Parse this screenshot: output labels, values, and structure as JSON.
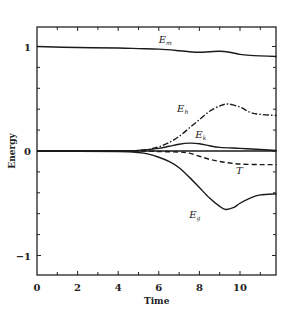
{
  "chart_data": {
    "type": "line",
    "title": "",
    "xlabel": "Time",
    "ylabel": "Energy",
    "xlim": [
      0,
      11.8
    ],
    "ylim": [
      -1.19,
      1.18
    ],
    "grid": false,
    "legend": "inline labels",
    "x_ticks": [
      0,
      2,
      4,
      6,
      8,
      10
    ],
    "x_tick_labels": [
      "0",
      "2",
      "4",
      "6",
      "8",
      "10"
    ],
    "y_ticks": [
      1,
      0,
      -1
    ],
    "y_tick_labels": [
      "1",
      "0",
      "−1"
    ],
    "series": [
      {
        "name": "Em",
        "label_main": "E",
        "label_sub": "m",
        "style": "solid",
        "x": [
          0,
          2,
          4,
          5,
          6,
          7,
          7.5,
          8,
          8.5,
          9,
          9.5,
          10,
          10.5,
          11,
          11.8
        ],
        "values": [
          1.0,
          0.99,
          0.985,
          0.98,
          0.975,
          0.96,
          0.95,
          0.945,
          0.95,
          0.955,
          0.945,
          0.925,
          0.915,
          0.91,
          0.905
        ]
      },
      {
        "name": "Eh",
        "label_main": "E",
        "label_sub": "h",
        "style": "dash-dot",
        "x": [
          0,
          4,
          5,
          5.5,
          6,
          6.5,
          7,
          7.5,
          8,
          8.5,
          9,
          9.4,
          10,
          10.5,
          11,
          11.8
        ],
        "values": [
          0,
          0.0,
          0.005,
          0.015,
          0.04,
          0.08,
          0.14,
          0.22,
          0.3,
          0.38,
          0.43,
          0.45,
          0.42,
          0.37,
          0.35,
          0.34
        ]
      },
      {
        "name": "Ek",
        "label_main": "E",
        "label_sub": "k",
        "style": "solid",
        "x": [
          0,
          4,
          5,
          6,
          6.5,
          7,
          7.5,
          8,
          8.5,
          9,
          10,
          11,
          11.8
        ],
        "values": [
          0,
          0.0,
          0.005,
          0.025,
          0.045,
          0.065,
          0.075,
          0.07,
          0.05,
          0.035,
          0.025,
          0.015,
          0.005
        ]
      },
      {
        "name": "zero",
        "label_main": "",
        "label_sub": "",
        "style": "solid",
        "x": [
          0,
          11.8
        ],
        "values": [
          0,
          0
        ]
      },
      {
        "name": "T",
        "label_main": "T",
        "label_sub": "",
        "style": "dashed",
        "x": [
          0,
          5,
          6,
          7,
          7.5,
          8,
          8.5,
          9,
          9.5,
          10,
          11,
          11.8
        ],
        "values": [
          0,
          0.0,
          -0.005,
          -0.01,
          -0.02,
          -0.05,
          -0.08,
          -0.1,
          -0.115,
          -0.125,
          -0.13,
          -0.13
        ]
      },
      {
        "name": "Eg",
        "label_main": "E",
        "label_sub": "g",
        "style": "solid",
        "x": [
          0,
          4,
          5,
          5.5,
          6,
          6.5,
          7,
          7.5,
          8,
          8.5,
          9,
          9.3,
          9.7,
          10,
          10.5,
          11,
          11.8
        ],
        "values": [
          0,
          -0.005,
          -0.015,
          -0.03,
          -0.06,
          -0.1,
          -0.16,
          -0.25,
          -0.35,
          -0.45,
          -0.53,
          -0.56,
          -0.54,
          -0.5,
          -0.45,
          -0.42,
          -0.41
        ]
      }
    ],
    "annotations": [
      {
        "text": "Em",
        "x": 6.0,
        "y": 1.03
      },
      {
        "text": "Eh",
        "x": 6.9,
        "y": 0.37
      },
      {
        "text": "Ek",
        "x": 7.8,
        "y": 0.12
      },
      {
        "text": "T",
        "x": 9.8,
        "y": -0.22
      },
      {
        "text": "Eg",
        "x": 7.5,
        "y": -0.64
      }
    ]
  }
}
